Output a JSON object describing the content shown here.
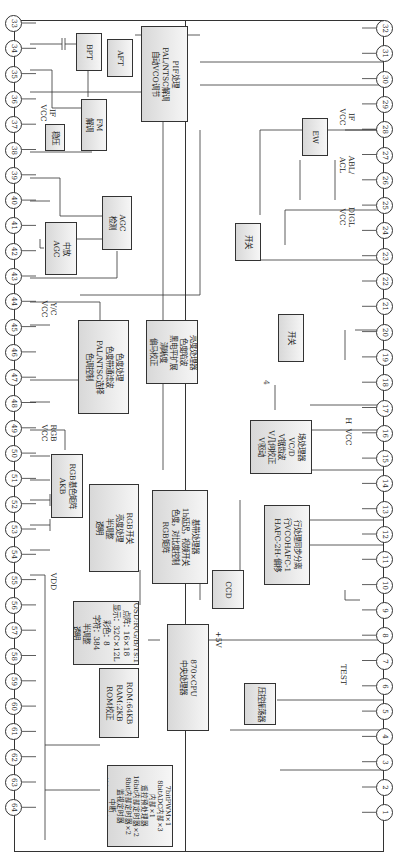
{
  "diagram": {
    "title": "",
    "pins_left": [
      "33",
      "34",
      "35",
      "36",
      "37",
      "38",
      "39",
      "40",
      "41",
      "42",
      "43",
      "44",
      "45",
      "46",
      "47",
      "48",
      "49",
      "50",
      "51",
      "52",
      "53",
      "54",
      "55",
      "56",
      "57",
      "58",
      "59",
      "60",
      "61",
      "62",
      "63",
      "64"
    ],
    "pins_right": [
      "32",
      "31",
      "30",
      "29",
      "28",
      "27",
      "26",
      "25",
      "24",
      "23",
      "22",
      "21",
      "20",
      "19",
      "18",
      "17",
      "16",
      "15",
      "14",
      "13",
      "12",
      "11",
      "10",
      "9",
      "8",
      "7",
      "6",
      "5",
      "4",
      "3",
      "2",
      "1"
    ],
    "blocks": {
      "bpt": "BPT",
      "aft": "AFT",
      "pif": "PIF处理\nPAL/NTSC解调\n自动VCO调节",
      "fm": "FM\n解调",
      "stab": "稳压",
      "if_agc": "中放\nAGC",
      "agc_det": "AGC\n检测",
      "chroma": "色度处理\n色度带通滤波\nPAL/NTSC选择\n色调控制",
      "luma": "亮度处理器\n色度陷波\n黑电平扩展\n清晰度\n偏马校正",
      "rgb_matrix": "RGB基色矩阵\nAKB",
      "rgb_switch": "RGB开关\n亮度处理\n半调整\n透明",
      "baseband": "基带处理器\n1h延迟，视频开关\n色度，对比度控制\nRGB矩阵",
      "osd": "OSD:R/G/B/Ys:1\n点阵：16×18\n显示：32C×12L\n彩色：8\n字符：384\n半调整\n透明",
      "rom": "ROM:64KB\nRAM:2KB\nROM校正",
      "cpu": "870×CPU\n中央处理器",
      "ccd": "CCD",
      "vco_osc": "压控振荡器",
      "io": "IO\n10I/O\n14bitPWM×1\n7bitPWM×1\n8bitADC内部×3\n内部×1\n遥控预处理器\n16bit内部定时器×2\n8bit内部定时器×2\n监视定时器\n中断\n外部×5，内部×11\nI²C总线接口\n外部×1，内部×1",
      "h_proc": "行处理同步分离\n行VCOHAFC-1\nHAFC-2H-偏移",
      "v_proc": "场处理器\nVC/D\nV锯齿波\nV几何校正\nV驱动",
      "switch_a": "开关",
      "switch_b": "开关",
      "ew": "EW"
    },
    "labels": {
      "if_vcc_left": "IF\nVCC",
      "yc_vcc": "Y/C\nVCC",
      "rgb_vcc": "RGB\nVCC",
      "vdd": "VDD",
      "plus5v": "+5V",
      "test": "TEST",
      "h_vcc": "H  VCC",
      "bus4": "4",
      "digl_vcc": "DIGL\nVCC",
      "abl_acl": "ABL/\nACL",
      "if_vcc_right": "IF\nVCC"
    }
  }
}
